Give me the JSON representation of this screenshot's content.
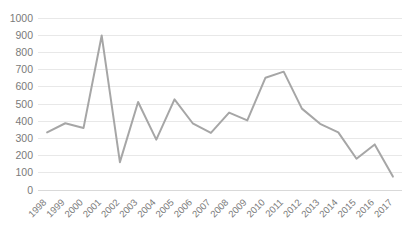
{
  "chart_data": {
    "type": "line",
    "title": "",
    "xlabel": "",
    "ylabel": "",
    "categories": [
      "1998",
      "1999",
      "2000",
      "2001",
      "2002",
      "2003",
      "2004",
      "2005",
      "2006",
      "2007",
      "2008",
      "2009",
      "2010",
      "2011",
      "2012",
      "2013",
      "2014",
      "2015",
      "2016",
      "2017"
    ],
    "values": [
      335,
      388,
      360,
      898,
      162,
      512,
      293,
      527,
      388,
      332,
      450,
      405,
      653,
      688,
      473,
      385,
      335,
      182,
      265,
      78
    ],
    "series": [
      {
        "name": "Series 1",
        "values": [
          335,
          388,
          360,
          898,
          162,
          512,
          293,
          527,
          388,
          332,
          450,
          405,
          653,
          688,
          473,
          385,
          335,
          182,
          265,
          78
        ],
        "color": "#a6a6a6"
      }
    ],
    "ylim": [
      0,
      1000
    ],
    "yticks": [
      0,
      100,
      200,
      300,
      400,
      500,
      600,
      700,
      800,
      900,
      1000
    ],
    "ytick_labels": [
      "0",
      "100",
      "200",
      "300",
      "400",
      "500",
      "600",
      "700",
      "800",
      "900",
      "1000"
    ],
    "xtick_labels": [
      "1998",
      "1999",
      "2000",
      "2001",
      "2002",
      "2003",
      "2004",
      "2005",
      "2006",
      "2007",
      "2008",
      "2009",
      "2010",
      "2011",
      "2012",
      "2013",
      "2014",
      "2015",
      "2016",
      "2017"
    ],
    "grid": true,
    "grid_axis": "y",
    "legend": false,
    "legend_position": "none",
    "markers": false,
    "annotations": []
  },
  "style": {
    "line_color": "#a6a6a6",
    "grid_color": "#e8e8e8",
    "axis_color": "#d9d9d9",
    "tick_label_color": "#7a7a7a",
    "background": "#ffffff",
    "xtick_rotation": -45
  }
}
